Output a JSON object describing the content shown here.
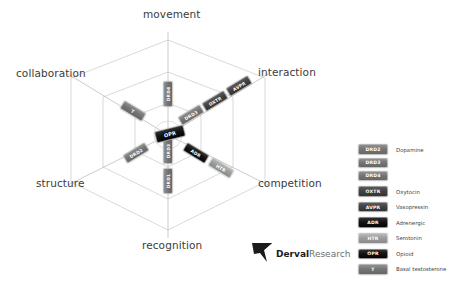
{
  "figure": {
    "type": "hexagonal-radar-3d",
    "axes": [
      {
        "key": "movement",
        "label": "movement"
      },
      {
        "key": "interaction",
        "label": "interaction"
      },
      {
        "key": "competition",
        "label": "competition"
      },
      {
        "key": "recognition",
        "label": "recognition"
      },
      {
        "key": "structure",
        "label": "structure"
      },
      {
        "key": "collaboration",
        "label": "collaboration"
      }
    ],
    "rings": 3,
    "center_marker": {
      "code": "OPR",
      "shade": "black"
    },
    "plotted_markers": [
      {
        "code": "DRD4",
        "axis": "movement",
        "ring": 2,
        "shade": "mid",
        "rotation": -90
      },
      {
        "code": "DRD3",
        "axis": "interaction",
        "ring": 1,
        "shade": "mid",
        "rotation": -30
      },
      {
        "code": "OXTR",
        "axis": "interaction",
        "ring": 2,
        "shade": "dark",
        "rotation": -30
      },
      {
        "code": "AVPR",
        "axis": "interaction",
        "ring": 3,
        "shade": "dark",
        "rotation": -30
      },
      {
        "code": "ADR",
        "axis": "competition",
        "ring": 1,
        "shade": "black",
        "rotation": 30
      },
      {
        "code": "HTR",
        "axis": "competition",
        "ring": 2,
        "shade": "light",
        "rotation": 30
      },
      {
        "code": "DRD3",
        "axis": "recognition",
        "ring": 1,
        "shade": "mid",
        "rotation": -90
      },
      {
        "code": "DRD1",
        "axis": "recognition",
        "ring": 2,
        "shade": "mid",
        "rotation": -90
      },
      {
        "code": "DRD2",
        "axis": "structure",
        "ring": 1,
        "shade": "mid",
        "rotation": -30
      },
      {
        "code": "T",
        "axis": "collaboration",
        "ring": 2,
        "shade": "mid",
        "rotation": 30
      }
    ]
  },
  "legend": {
    "items": [
      {
        "code": "DRD2",
        "label": "Dopamine",
        "shade": "mid",
        "group_start": true
      },
      {
        "code": "DRD3",
        "label": "",
        "shade": "mid",
        "group_start": false
      },
      {
        "code": "DRD4",
        "label": "",
        "shade": "mid",
        "group_start": false
      },
      {
        "code": "OXTR",
        "label": "Oxytocin",
        "shade": "dark",
        "group_start": true
      },
      {
        "code": "AVPR",
        "label": "Vasopressin",
        "shade": "dark",
        "group_start": true
      },
      {
        "code": "ADR",
        "label": "Adrenergic",
        "shade": "black",
        "group_start": true
      },
      {
        "code": "HTR",
        "label": "Serotonin",
        "shade": "light",
        "group_start": true
      },
      {
        "code": "OPR",
        "label": "Opioid",
        "shade": "black",
        "group_start": true
      },
      {
        "code": "T",
        "label": "Basal testosterone",
        "shade": "mid",
        "group_start": true
      }
    ]
  },
  "logo": {
    "brand_bold": "Derval",
    "brand_light": "Research"
  },
  "colors": {
    "grid_line": "#c9c9c9",
    "axis_line": "#b5b5b5",
    "label_text": "#3b3b3b",
    "legend_text": "#454545"
  }
}
